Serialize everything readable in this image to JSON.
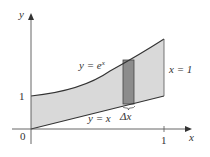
{
  "diagram": {
    "colors": {
      "region_fill": "#d9d9d9",
      "strip_fill": "#8c8c8c",
      "curve_stroke": "#333333",
      "axis_stroke": "#555555"
    },
    "axes": {
      "x_label": "x",
      "y_label": "y",
      "origin_label": "0",
      "x_tick_label": "1",
      "y_tick_label": "1"
    },
    "curves": {
      "upper_label_y": "y = e",
      "upper_label_exp": "x",
      "lower_label": "y = x",
      "boundary_label": "x = 1"
    },
    "strip": {
      "label": "Δx"
    }
  }
}
